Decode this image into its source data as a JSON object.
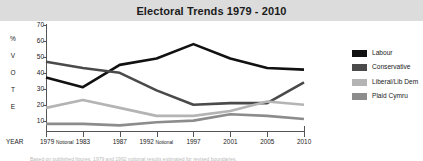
{
  "header": {
    "title": "Electoral Trends 1979 - 2010"
  },
  "axis": {
    "year_caption": "YEAR",
    "vertical_title_letters": [
      "%",
      "V",
      "O",
      "T",
      "E"
    ],
    "y_tick_labels": [
      "70",
      "60",
      "50",
      "40",
      "30",
      "20",
      "10"
    ]
  },
  "legend": {
    "items": [
      {
        "label": "Labour",
        "color": "#111111"
      },
      {
        "label": "Conservative",
        "color": "#4a4a4a"
      },
      {
        "label": "Liberal/Lib Dem",
        "color": "#b4b4b4"
      },
      {
        "label": "Plaid Cymru",
        "color": "#8c8c8c"
      }
    ]
  },
  "footer": {
    "cut_off_caption": "Based on published figures.  1979 and 1992 notional results estimated for revised boundaries."
  },
  "chart_data": {
    "type": "line",
    "title": "Electoral Trends 1979 - 2010",
    "xlabel": "YEAR",
    "ylabel": "% VOTE",
    "ylim": [
      0,
      70
    ],
    "yticks": [
      10,
      20,
      30,
      40,
      50,
      60,
      70
    ],
    "grid": false,
    "legend_position": "right",
    "categories": [
      "1979 Notional",
      "1983",
      "1987",
      "1992 Notional",
      "1997",
      "2001",
      "2005",
      "2010"
    ],
    "x_tick_labels": [
      {
        "year": "1979",
        "note": "Notional"
      },
      {
        "year": "1983",
        "note": ""
      },
      {
        "year": "1987",
        "note": ""
      },
      {
        "year": "1992",
        "note": "Notional"
      },
      {
        "year": "1997",
        "note": ""
      },
      {
        "year": "2001",
        "note": ""
      },
      {
        "year": "2005",
        "note": ""
      },
      {
        "year": "2010",
        "note": ""
      }
    ],
    "series": [
      {
        "name": "Labour",
        "color": "#111111",
        "values": [
          37,
          31,
          45,
          49,
          58,
          49,
          43,
          42
        ]
      },
      {
        "name": "Conservative",
        "color": "#4a4a4a",
        "values": [
          47,
          43,
          40,
          29,
          20,
          21,
          21,
          34
        ]
      },
      {
        "name": "Liberal/Lib Dem",
        "color": "#b4b4b4",
        "values": [
          18,
          23,
          18,
          13,
          13,
          16,
          22,
          20
        ]
      },
      {
        "name": "Plaid Cymru",
        "color": "#8c8c8c",
        "values": [
          8,
          8,
          7,
          9,
          10,
          14,
          13,
          11
        ]
      }
    ]
  }
}
